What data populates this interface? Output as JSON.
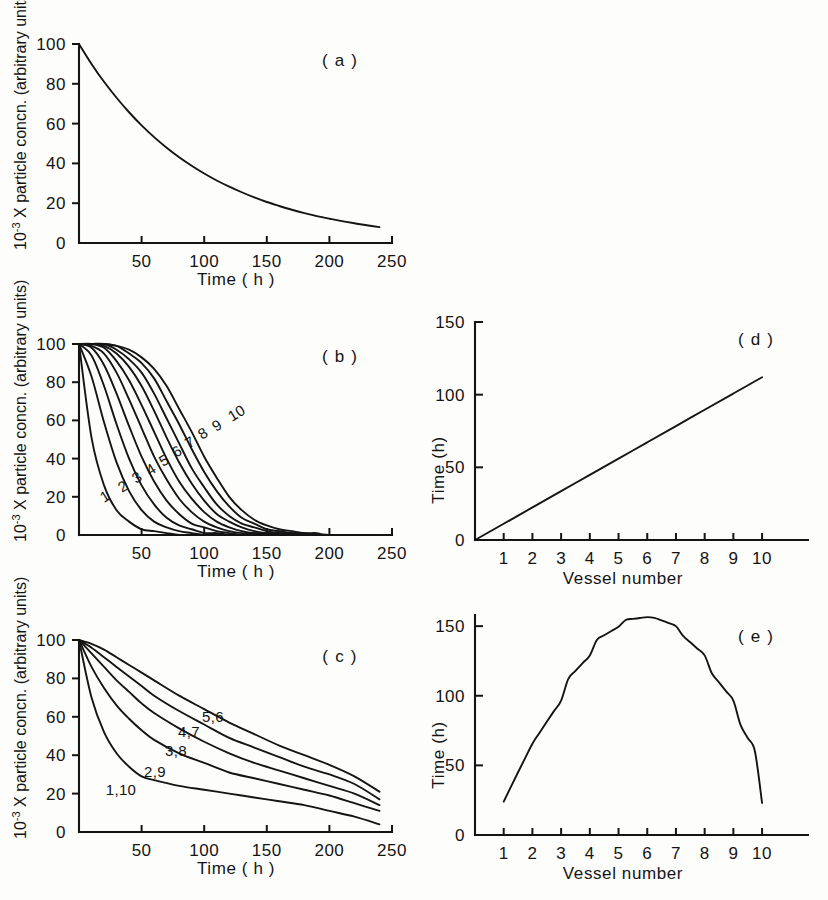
{
  "figure": {
    "background_color": "#fdfdfb",
    "curve_color": "#141414",
    "axis_color": "#141414"
  },
  "labels": {
    "panel_a": "( a )",
    "panel_b": "( b )",
    "panel_c": "( c )",
    "panel_d": "( d )",
    "panel_e": "( e )",
    "y_conc_prefix": "10",
    "y_conc_exponent": "-3",
    "y_conc_rest": " X particle concn. (arbitrary units)",
    "y_time": "Time (h)",
    "x_time": "Time ( h )",
    "x_vessel": "Vessel number"
  },
  "conc_axis": {
    "x_ticks": [
      "50",
      "100",
      "150",
      "200",
      "250"
    ],
    "x_tick_values": [
      50,
      100,
      150,
      200,
      250
    ],
    "y_ticks": [
      "0",
      "20",
      "40",
      "60",
      "80",
      "100"
    ],
    "y_tick_values": [
      0,
      20,
      40,
      60,
      80,
      100
    ],
    "xlim": [
      0,
      250
    ],
    "ylim": [
      0,
      100
    ]
  },
  "vessel_axis": {
    "x_ticks": [
      "1",
      "2",
      "3",
      "4",
      "5",
      "6",
      "7",
      "8",
      "9",
      "10"
    ],
    "x_tick_values": [
      1,
      2,
      3,
      4,
      5,
      6,
      7,
      8,
      9,
      10
    ],
    "y_ticks": [
      "0",
      "50",
      "100",
      "150"
    ],
    "y_tick_values": [
      0,
      50,
      100,
      150
    ],
    "xlim": [
      0,
      11.6
    ],
    "ylim": [
      0,
      158
    ]
  },
  "chart_data": [
    {
      "id": "panel-a",
      "type": "line",
      "title": "( a )",
      "xlabel": "Time ( h )",
      "ylabel": "10-3 X particle concn. (arbitrary units)",
      "xlim": [
        0,
        250
      ],
      "ylim": [
        0,
        100
      ],
      "grid": false,
      "legend": "none",
      "x": [
        0,
        10,
        20,
        30,
        40,
        50,
        60,
        70,
        80,
        90,
        100,
        110,
        120,
        130,
        140,
        150,
        160,
        170,
        180,
        190,
        200,
        210,
        220,
        230,
        240
      ],
      "series": [
        {
          "name": "single vessel washout",
          "values": [
            100.0,
            90.0,
            81.0,
            73.0,
            65.7,
            59.1,
            53.2,
            47.9,
            43.1,
            38.8,
            34.9,
            31.4,
            28.3,
            25.5,
            22.9,
            20.6,
            18.6,
            16.7,
            15.0,
            13.5,
            12.2,
            11.0,
            9.9,
            8.9,
            8.0
          ]
        }
      ]
    },
    {
      "id": "panel-b",
      "type": "line",
      "title": "( b )",
      "xlabel": "Time ( h )",
      "ylabel": "10-3 X particle concn. (arbitrary units)",
      "xlim": [
        0,
        250
      ],
      "ylim": [
        0,
        100
      ],
      "grid": false,
      "legend": "inline curve numbers",
      "curve_labels": [
        "1",
        "2",
        "3",
        "4",
        "5",
        "6",
        "7",
        "8",
        "9",
        "10"
      ],
      "x": [
        0,
        10,
        20,
        30,
        40,
        50,
        60,
        70,
        80,
        90,
        100,
        110,
        120,
        130,
        140,
        150,
        160,
        170,
        180,
        190,
        200
      ],
      "series": [
        {
          "name": "1",
          "values": [
            100,
            51,
            26,
            13,
            7,
            3,
            2,
            1,
            0,
            0,
            0,
            0,
            0,
            0,
            0,
            0,
            0,
            0,
            0,
            0,
            0
          ]
        },
        {
          "name": "2",
          "values": [
            100,
            83,
            59,
            38,
            23,
            13,
            7,
            4,
            2,
            1,
            0,
            0,
            0,
            0,
            0,
            0,
            0,
            0,
            0,
            0,
            0
          ]
        },
        {
          "name": "3",
          "values": [
            100,
            94,
            78,
            58,
            40,
            26,
            16,
            9,
            5,
            3,
            1,
            1,
            0,
            0,
            0,
            0,
            0,
            0,
            0,
            0,
            0
          ]
        },
        {
          "name": "4",
          "values": [
            100,
            98,
            89,
            74,
            57,
            41,
            28,
            18,
            11,
            6,
            4,
            2,
            1,
            0,
            0,
            0,
            0,
            0,
            0,
            0,
            0
          ]
        },
        {
          "name": "5",
          "values": [
            100,
            99,
            95,
            85,
            71,
            56,
            41,
            29,
            19,
            12,
            7,
            4,
            2,
            1,
            1,
            0,
            0,
            0,
            0,
            0,
            0
          ]
        },
        {
          "name": "6",
          "values": [
            100,
            100,
            98,
            91,
            81,
            68,
            54,
            40,
            28,
            19,
            12,
            7,
            4,
            2,
            1,
            1,
            0,
            0,
            0,
            0,
            0
          ]
        },
        {
          "name": "7",
          "values": [
            100,
            100,
            99,
            95,
            88,
            78,
            65,
            51,
            38,
            27,
            18,
            11,
            7,
            4,
            2,
            1,
            1,
            0,
            0,
            0,
            0
          ]
        },
        {
          "name": "8",
          "values": [
            100,
            100,
            100,
            97,
            92,
            85,
            74,
            61,
            48,
            35,
            25,
            16,
            10,
            6,
            4,
            2,
            1,
            1,
            0,
            0,
            0
          ]
        },
        {
          "name": "9",
          "values": [
            100,
            100,
            100,
            99,
            95,
            90,
            82,
            70,
            58,
            45,
            33,
            23,
            15,
            9,
            6,
            3,
            2,
            1,
            1,
            0,
            0
          ]
        },
        {
          "name": "10",
          "values": [
            100,
            100,
            100,
            99,
            97,
            93,
            87,
            78,
            66,
            54,
            41,
            30,
            20,
            13,
            8,
            5,
            3,
            2,
            1,
            1,
            0
          ]
        }
      ]
    },
    {
      "id": "panel-c",
      "type": "line",
      "title": "( c )",
      "xlabel": "Time ( h )",
      "ylabel": "10-3 X particle concn. (arbitrary units)",
      "xlim": [
        0,
        250
      ],
      "ylim": [
        0,
        100
      ],
      "grid": false,
      "legend": "inline curve numbers",
      "curve_labels": [
        "1,10",
        "2,9",
        "3,8",
        "4,7",
        "5,6"
      ],
      "x": [
        0,
        10,
        20,
        30,
        40,
        50,
        60,
        80,
        100,
        120,
        140,
        160,
        180,
        200,
        220,
        240
      ],
      "series": [
        {
          "name": "1,10",
          "values": [
            100,
            70,
            52,
            41,
            34,
            29,
            27,
            24,
            22,
            20,
            18,
            16,
            14,
            11,
            8,
            4
          ]
        },
        {
          "name": "2,9",
          "values": [
            100,
            86,
            75,
            66,
            59,
            53,
            48,
            41,
            36,
            31,
            28,
            25,
            22,
            19,
            15,
            11
          ]
        },
        {
          "name": "3,8",
          "values": [
            100,
            93,
            86,
            79,
            73,
            67,
            62,
            54,
            47,
            41,
            36,
            32,
            28,
            24,
            20,
            14
          ]
        },
        {
          "name": "4,7",
          "values": [
            100,
            96,
            91,
            86,
            81,
            76,
            71,
            63,
            56,
            49,
            44,
            39,
            34,
            30,
            25,
            17
          ]
        },
        {
          "name": "5,6",
          "values": [
            100,
            98,
            95,
            91,
            87,
            83,
            79,
            71,
            64,
            57,
            51,
            45,
            40,
            35,
            29,
            21
          ]
        }
      ]
    },
    {
      "id": "panel-d",
      "type": "line",
      "title": "( d )",
      "xlabel": "Vessel number",
      "ylabel": "Time (h)",
      "xlim": [
        0,
        11.6
      ],
      "ylim": [
        0,
        150
      ],
      "grid": false,
      "legend": "none",
      "x": [
        0,
        1,
        2,
        3,
        4,
        5,
        6,
        7,
        8,
        9,
        10
      ],
      "series": [
        {
          "name": "time vs vessel (linear)",
          "values": [
            0,
            11.2,
            22.4,
            33.6,
            44.8,
            56.0,
            67.2,
            78.4,
            89.6,
            100.8,
            112.0
          ]
        }
      ]
    },
    {
      "id": "panel-e",
      "type": "line",
      "title": "( e )",
      "xlabel": "Vessel number",
      "ylabel": "Time (h)",
      "xlim": [
        0,
        11.6
      ],
      "ylim": [
        0,
        158
      ],
      "grid": false,
      "legend": "none",
      "x": [
        1,
        2,
        3,
        4,
        5,
        6,
        7,
        8,
        9,
        10
      ],
      "series": [
        {
          "name": "time vs vessel (parabolic)",
          "values": [
            24,
            78,
            115,
            143,
            156,
            157,
            143,
            115,
            78,
            23
          ]
        }
      ]
    }
  ]
}
